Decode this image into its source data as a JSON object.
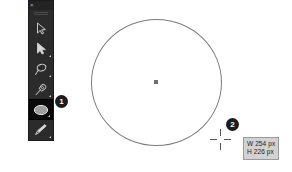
{
  "app": {
    "background_color": "#ffffff",
    "canvas_size": {
      "width": 292,
      "height": 172
    }
  },
  "toolbar": {
    "close_label": "×",
    "background_color": "#2b2b2b",
    "tools": [
      {
        "id": "selection-tool",
        "icon": "arrow-cursor-icon",
        "label": "Selection",
        "selected": false,
        "has_flyout": false
      },
      {
        "id": "direct-selection-tool",
        "icon": "filled-arrow-cursor-icon",
        "label": "Direct Selection",
        "selected": false,
        "has_flyout": true
      },
      {
        "id": "lasso-tool",
        "icon": "lasso-icon",
        "label": "Lasso",
        "selected": false,
        "has_flyout": true
      },
      {
        "id": "pen-tool",
        "icon": "pen-nib-icon",
        "label": "Pen",
        "selected": false,
        "has_flyout": true
      },
      {
        "id": "ellipse-tool",
        "icon": "ellipse-icon",
        "label": "Ellipse",
        "selected": true,
        "has_flyout": true
      },
      {
        "id": "paintbrush-tool",
        "icon": "paintbrush-icon",
        "label": "Paintbrush",
        "selected": false,
        "has_flyout": true
      }
    ]
  },
  "canvas": {
    "shape": {
      "name": "ellipse",
      "stroke_color": "#7c7c7c"
    },
    "center_anchor": {
      "color": "#6f6f6f"
    },
    "cursor": {
      "name": "crosshair",
      "color": "#555555"
    }
  },
  "dimension_tooltip": {
    "width_line": "W 254 px",
    "height_line": "H 226 px",
    "background_color": "#d2d2d2",
    "text_color": "#1a1a1a"
  },
  "annotations": [
    {
      "id": "marker-1",
      "number": "1"
    },
    {
      "id": "marker-2",
      "number": "2"
    }
  ]
}
